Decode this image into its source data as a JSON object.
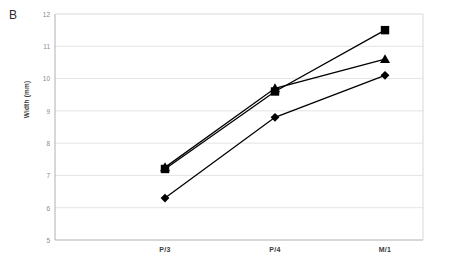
{
  "panel": {
    "label": "B"
  },
  "chart_data": {
    "type": "line",
    "title": "",
    "subtitle": "",
    "xlabel": "",
    "ylabel": "Width (mm)",
    "categories": [
      "P/3",
      "P/4",
      "M/1"
    ],
    "ylim": [
      5,
      12
    ],
    "yticks": [
      5,
      6,
      7,
      8,
      9,
      10,
      11,
      12
    ],
    "ytick_labels": [
      "5",
      "6",
      "7",
      "8",
      "9",
      "10",
      "11",
      "12"
    ],
    "grid": true,
    "grid_axis": "y",
    "legend": "none",
    "series": [
      {
        "name": "series-diamond",
        "marker": "diamond",
        "color": "#000000",
        "values": [
          6.3,
          8.8,
          10.1
        ]
      },
      {
        "name": "series-triangle",
        "marker": "triangle",
        "color": "#000000",
        "values": [
          7.25,
          9.7,
          10.6
        ]
      },
      {
        "name": "series-square",
        "marker": "square",
        "color": "#000000",
        "values": [
          7.2,
          9.6,
          11.5
        ]
      }
    ],
    "annotations": [
      "B"
    ],
    "colors": {
      "line": "#000000",
      "marker": "#000000",
      "grid": "#e4e4e4",
      "axis": "#b8b8b8",
      "tick_text": "#8a8a8a",
      "label_text": "#3a3a3a"
    }
  }
}
